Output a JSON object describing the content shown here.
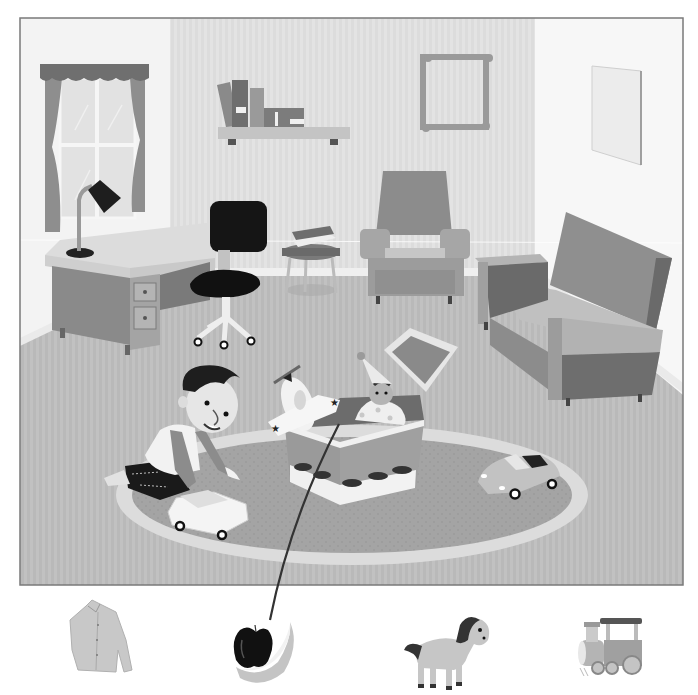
{
  "puzzle": {
    "kind": "match-the-object",
    "style": "grayscale",
    "scene": {
      "setting": "bedroom-study",
      "objects": [
        {
          "id": "window",
          "label": "window with curtains"
        },
        {
          "id": "bookshelf",
          "label": "wall shelf with books"
        },
        {
          "id": "picture-frame",
          "label": "empty picture frame"
        },
        {
          "id": "wall-panel",
          "label": "blank wall picture"
        },
        {
          "id": "desk",
          "label": "desk with drawers"
        },
        {
          "id": "desk-lamp",
          "label": "desk lamp"
        },
        {
          "id": "office-chair",
          "label": "office chair"
        },
        {
          "id": "stool",
          "label": "stool with books"
        },
        {
          "id": "armchair",
          "label": "armchair"
        },
        {
          "id": "sofa",
          "label": "sofa"
        },
        {
          "id": "rug",
          "label": "oval rug"
        },
        {
          "id": "boy",
          "label": "boy playing"
        },
        {
          "id": "toy-car-white",
          "label": "toy car"
        },
        {
          "id": "toy-box",
          "label": "toy box with cars pattern"
        },
        {
          "id": "toy-plane",
          "label": "toy airplane"
        },
        {
          "id": "jack-in-the-box",
          "label": "clown doll"
        },
        {
          "id": "toy-convertible",
          "label": "toy convertible"
        }
      ]
    },
    "choices": [
      {
        "id": "shirt",
        "label": "shirt"
      },
      {
        "id": "fruit",
        "label": "apple and banana"
      },
      {
        "id": "horse",
        "label": "toy horse"
      },
      {
        "id": "train",
        "label": "toy train"
      }
    ],
    "connection": {
      "from": "toy-box",
      "to": "fruit"
    },
    "palette": {
      "frame_border": "#7a7a7a",
      "wall_light": "#f4f4f4",
      "wall_mid": "#dedede",
      "floor": "#b8b8b8",
      "furniture_dark": "#8a8a8a",
      "furniture_mid": "#a6a6a6",
      "black": "#1a1a1a",
      "line": "#3a3a3a"
    }
  }
}
